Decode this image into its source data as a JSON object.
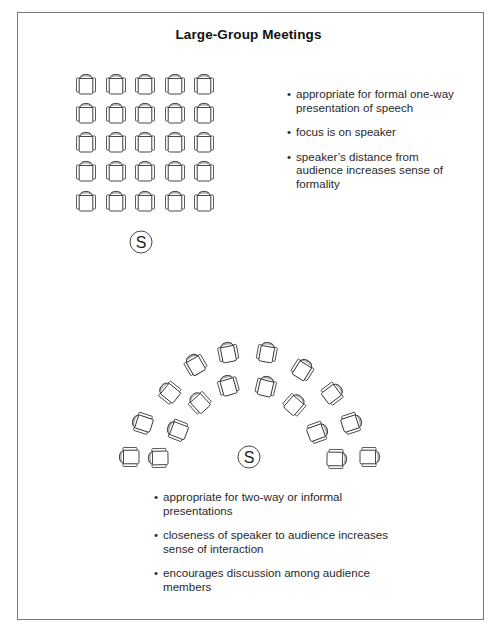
{
  "title": "Large-Group Meetings",
  "colors": {
    "line": "#333333",
    "frame": "#7a7a7a",
    "text": "#2a2a2a"
  },
  "speaker_label": "S",
  "section_formal": {
    "layout": "grid",
    "rows": 5,
    "cols": 5,
    "col_x": [
      86,
      116,
      145,
      175,
      204
    ],
    "row_y": [
      84,
      113,
      142,
      171,
      201
    ],
    "speaker": {
      "x": 141,
      "y": 242
    },
    "bullets": [
      "appropriate for formal one-way presentation of speech",
      "focus is on speaker",
      "speaker’s distance from audience increases sense of formality"
    ]
  },
  "section_informal": {
    "layout": "arc",
    "speaker": {
      "x": 249,
      "y": 457
    },
    "chairs": [
      {
        "x": 129,
        "y": 457,
        "rot": -90
      },
      {
        "x": 142,
        "y": 423,
        "rot": -72
      },
      {
        "x": 169,
        "y": 392,
        "rot": -51
      },
      {
        "x": 195,
        "y": 364,
        "rot": -30
      },
      {
        "x": 228,
        "y": 352,
        "rot": -11
      },
      {
        "x": 158,
        "y": 458,
        "rot": -91
      },
      {
        "x": 177,
        "y": 430,
        "rot": -69
      },
      {
        "x": 199,
        "y": 402,
        "rot": -42
      },
      {
        "x": 228,
        "y": 385,
        "rot": -16
      },
      {
        "x": 267,
        "y": 352,
        "rot": 10
      },
      {
        "x": 303,
        "y": 369,
        "rot": 32
      },
      {
        "x": 333,
        "y": 393,
        "rot": 53
      },
      {
        "x": 352,
        "y": 423,
        "rot": 72
      },
      {
        "x": 370,
        "y": 457,
        "rot": 90
      },
      {
        "x": 266,
        "y": 386,
        "rot": 13
      },
      {
        "x": 295,
        "y": 404,
        "rot": 41
      },
      {
        "x": 318,
        "y": 432,
        "rot": 70
      },
      {
        "x": 337,
        "y": 459,
        "rot": 91
      }
    ],
    "bullets": [
      "appropriate for two-way or informal presentations",
      "closeness of speaker to audience increases sense of interaction",
      "encourages discussion among audience members"
    ]
  },
  "bullet_glyph": "•"
}
